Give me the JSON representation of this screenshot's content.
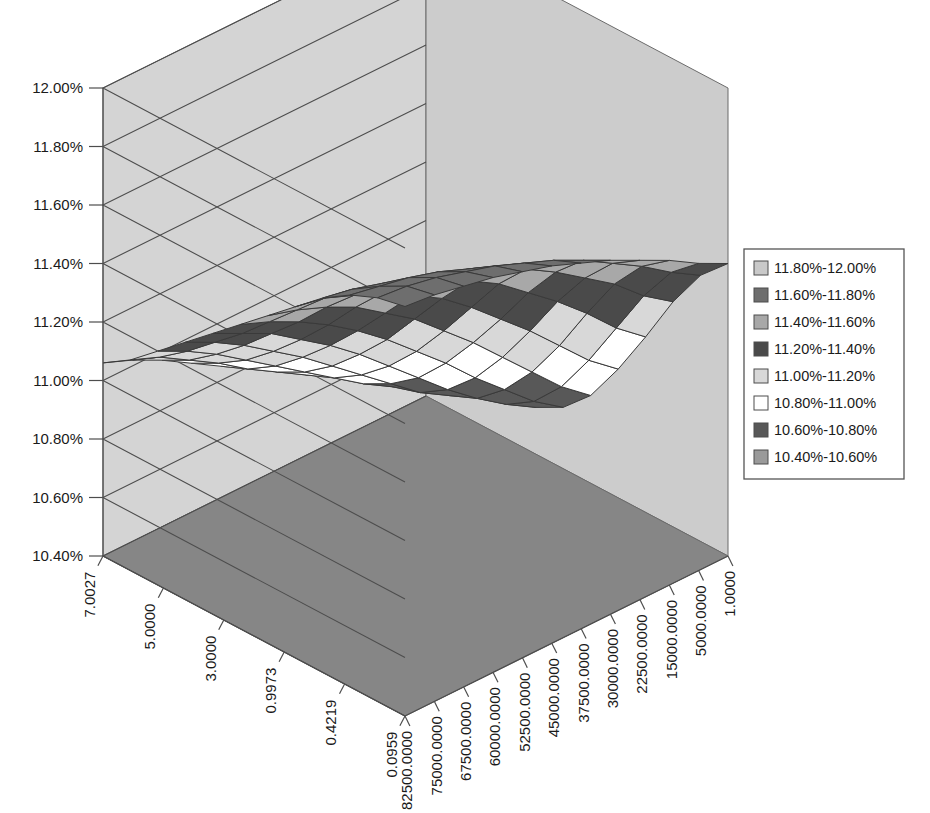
{
  "chart_data": {
    "type": "surface",
    "title": "",
    "xlabel": "",
    "ylabel": "",
    "zlabel": "",
    "grid": true,
    "legend_position": "right",
    "z_axis": {
      "label": "",
      "ticks": [
        "12.00%",
        "11.80%",
        "11.60%",
        "11.40%",
        "11.20%",
        "11.00%",
        "10.80%",
        "10.60%",
        "10.40%"
      ],
      "min": 10.4,
      "max": 12.0,
      "step": 0.2,
      "unit": "%"
    },
    "x_axis": {
      "label": "",
      "ticks": [
        "7.0027",
        "5.0000",
        "3.0000",
        "0.9973",
        "0.4219",
        "0.0959"
      ],
      "values": [
        7.0027,
        5.0,
        3.0,
        0.9973,
        0.4219,
        0.0959
      ]
    },
    "y_axis": {
      "label": "",
      "ticks": [
        "82500.0000",
        "75000.0000",
        "67500.0000",
        "60000.0000",
        "52500.0000",
        "45000.0000",
        "37500.0000",
        "30000.0000",
        "22500.0000",
        "15000.0000",
        "5000.0000",
        "1.0000"
      ],
      "values": [
        82500.0,
        75000.0,
        67500.0,
        60000.0,
        52500.0,
        45000.0,
        37500.0,
        30000.0,
        22500.0,
        15000.0,
        5000.0,
        1.0
      ]
    },
    "legend": {
      "entries": [
        {
          "label": "11.80%-12.00%",
          "color": "#c9c9c9",
          "min": 11.8,
          "max": 12.0
        },
        {
          "label": "11.60%-11.80%",
          "color": "#6e6e6e",
          "min": 11.6,
          "max": 11.8
        },
        {
          "label": "11.40%-11.60%",
          "color": "#a8a8a8",
          "min": 11.4,
          "max": 11.6
        },
        {
          "label": "11.20%-11.40%",
          "color": "#4a4a4a",
          "min": 11.2,
          "max": 11.4
        },
        {
          "label": "11.00%-11.20%",
          "color": "#d8d8d8",
          "min": 11.0,
          "max": 11.2
        },
        {
          "label": "10.80%-11.00%",
          "color": "#ffffff",
          "min": 10.8,
          "max": 11.0
        },
        {
          "label": "10.60%-10.80%",
          "color": "#585858",
          "min": 10.6,
          "max": 10.8
        },
        {
          "label": "10.40%-10.60%",
          "color": "#9a9a9a",
          "min": 10.4,
          "max": 10.6
        }
      ]
    },
    "surface_rows": [
      {
        "y": 82500.0,
        "values": [
          11.8,
          11.78,
          11.74,
          11.68,
          11.6,
          11.52,
          11.44,
          11.36,
          11.28,
          11.2,
          11.12,
          11.06
        ]
      },
      {
        "y": 75000.0,
        "values": [
          11.79,
          11.77,
          11.72,
          11.66,
          11.58,
          11.49,
          11.4,
          11.31,
          11.23,
          11.15,
          11.08,
          11.02
        ]
      },
      {
        "y": 67500.0,
        "values": [
          11.77,
          11.75,
          11.7,
          11.63,
          11.54,
          11.45,
          11.35,
          11.26,
          11.17,
          11.09,
          11.02,
          10.97
        ]
      },
      {
        "y": 60000.0,
        "values": [
          11.75,
          11.72,
          11.67,
          11.59,
          11.5,
          11.4,
          11.29,
          11.19,
          11.1,
          11.02,
          10.96,
          10.91
        ]
      },
      {
        "y": 52500.0,
        "values": [
          11.72,
          11.69,
          11.63,
          11.55,
          11.44,
          11.33,
          11.22,
          11.12,
          11.03,
          10.95,
          10.89,
          10.85
        ]
      },
      {
        "y": 45000.0,
        "values": [
          11.69,
          11.65,
          11.59,
          11.49,
          11.38,
          11.26,
          11.14,
          11.04,
          10.95,
          10.88,
          10.83,
          10.8
        ]
      },
      {
        "y": 37500.0,
        "values": [
          11.65,
          11.61,
          11.53,
          11.43,
          11.3,
          11.17,
          11.05,
          10.95,
          10.87,
          10.81,
          10.77,
          10.75
        ]
      },
      {
        "y": 30000.0,
        "values": [
          11.61,
          11.56,
          11.47,
          11.35,
          11.21,
          11.08,
          10.96,
          10.86,
          10.79,
          10.74,
          10.72,
          10.72
        ]
      },
      {
        "y": 22500.0,
        "values": [
          11.56,
          11.5,
          11.4,
          11.27,
          11.12,
          10.98,
          10.86,
          10.77,
          10.71,
          10.68,
          10.68,
          10.7
        ]
      },
      {
        "y": 15000.0,
        "values": [
          11.51,
          11.44,
          11.33,
          11.18,
          11.02,
          10.88,
          10.77,
          10.69,
          10.65,
          10.64,
          10.66,
          10.7
        ]
      },
      {
        "y": 5000.0,
        "values": [
          11.45,
          11.37,
          11.24,
          11.08,
          10.92,
          10.78,
          10.68,
          10.62,
          10.6,
          10.61,
          10.65,
          10.71
        ]
      },
      {
        "y": 1.0,
        "values": [
          11.4,
          11.31,
          11.17,
          11.0,
          10.84,
          10.7,
          10.61,
          10.56,
          10.56,
          10.59,
          10.65,
          10.73
        ]
      }
    ]
  },
  "walls": {
    "back_color": "#d4d4d4",
    "right_color": "#cccccc",
    "floor_color": "#868686",
    "grid_color": "#4d4d4d",
    "edge_color": "#6b6b6b"
  }
}
